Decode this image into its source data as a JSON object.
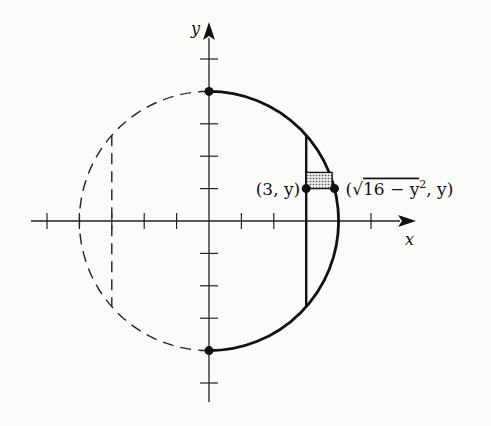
{
  "figure": {
    "type": "coordinate-diagram",
    "axes": {
      "x_label": "x",
      "y_label": "y",
      "x_range": [
        -5,
        5
      ],
      "y_range": [
        -5,
        5
      ],
      "tick_step": 1,
      "x_ticks": [
        -5,
        -4,
        -3,
        -2,
        -1,
        1,
        2,
        3,
        4,
        5
      ],
      "y_ticks": [
        -5,
        -4,
        -3,
        -2,
        -1,
        1,
        2,
        3,
        4,
        5
      ]
    },
    "circle": {
      "center": [
        0,
        0
      ],
      "radius": 4,
      "left_half_style": "dashed",
      "right_half_style": "solid-bold"
    },
    "solid_line": {
      "x": 3,
      "from_y": -2.6458,
      "to_y": 2.6458
    },
    "dashed_line": {
      "x": -3,
      "from_y": -2.6458,
      "to_y": 2.6458
    },
    "points": [
      {
        "name": "top",
        "x": 0,
        "y": 4
      },
      {
        "name": "bottom",
        "x": 0,
        "y": -4
      },
      {
        "name": "left-end",
        "x": 3,
        "y": 1,
        "label": "(3, y)"
      },
      {
        "name": "right-end",
        "x": 3.873,
        "y": 1,
        "label": "(√16 − y², y)"
      }
    ],
    "strip": {
      "x_from": 3,
      "y": 1,
      "height": 0.5,
      "fill": "dotted-gray"
    },
    "labels": {
      "left_point": "(3, y)",
      "right_point_open": "(",
      "right_point_sqrt": "√",
      "right_point_radicand": "16 − y",
      "right_point_exp": "2",
      "right_point_close": ", y)"
    }
  }
}
